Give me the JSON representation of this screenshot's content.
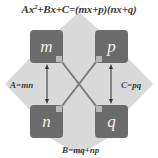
{
  "diagram": {
    "title": {
      "lhs_a": "Ax",
      "exp": "2",
      "rest": "+Bx+C=(mx+p)(nx+q)"
    },
    "boxes": {
      "top_left": "m",
      "top_right": "p",
      "bottom_left": "n",
      "bottom_right": "q"
    },
    "labels": {
      "left": "A=mn",
      "right": "C=pq",
      "bottom": "B=mq+np"
    },
    "colors": {
      "box": "#6b6b6b",
      "background_shape": "#d9d9d9",
      "lines": "#7a7a7a",
      "text": "#3a3a3a"
    }
  }
}
